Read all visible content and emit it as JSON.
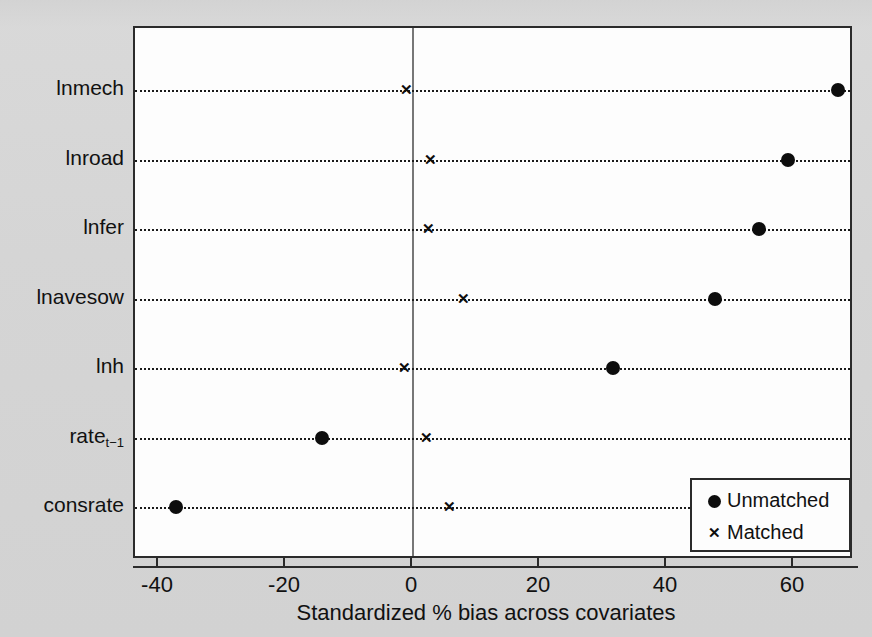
{
  "chart_data": {
    "type": "scatter",
    "title": "",
    "xlabel": "Standardized % bias across covariates",
    "ylabel": "",
    "xlim": [
      -47,
      70
    ],
    "xticks": [
      -40,
      -20,
      0,
      20,
      40,
      60
    ],
    "xticklabels": [
      "-40",
      "-20",
      "0",
      "20",
      "40",
      "60"
    ],
    "grid": "dotted horizontal row guides",
    "zero_reference_line": 0,
    "legend_position": "bottom-right inside axes",
    "categories": [
      "lnmech",
      "lnroad",
      "lnfer",
      "lnavesow",
      "lnh",
      "rate_{t-1}",
      "consrate"
    ],
    "category_labels": [
      "lnmech",
      "lnroad",
      "lnfer",
      "lnavesow",
      "lnh",
      "rate",
      "consrate"
    ],
    "series": [
      {
        "name": "Unmatched",
        "marker": "filled-circle",
        "color": "#0d0d0d",
        "values": [
          67.0,
          59.0,
          54.5,
          47.5,
          31.5,
          -14.3,
          -37.3
        ]
      },
      {
        "name": "Matched",
        "marker": "x",
        "color": "#0d0d0d",
        "values": [
          -1.1,
          2.8,
          2.5,
          8.0,
          -1.3,
          2.2,
          5.8
        ]
      }
    ]
  },
  "axis": {
    "y_labels": [
      {
        "text": "lnmech",
        "sub": ""
      },
      {
        "text": "lnroad",
        "sub": ""
      },
      {
        "text": "lnfer",
        "sub": ""
      },
      {
        "text": "lnavesow",
        "sub": ""
      },
      {
        "text": "lnh",
        "sub": ""
      },
      {
        "text": "rate",
        "sub": "t−1"
      },
      {
        "text": "consrate",
        "sub": ""
      }
    ]
  },
  "legend": {
    "entries": [
      {
        "symbol": "filled-circle",
        "label": "Unmatched"
      },
      {
        "symbol": "x",
        "label": "Matched"
      }
    ]
  },
  "colors": {
    "page_background": "#d7d7d7",
    "plot_background": "#fdfdfd",
    "frame": "#2b2b2b",
    "marker": "#0d0d0d",
    "zero_line": "#777777"
  }
}
